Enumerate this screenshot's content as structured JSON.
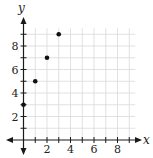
{
  "chart_data": {
    "type": "scatter",
    "title": "",
    "xlabel": "x",
    "ylabel": "y",
    "x": [
      0,
      1,
      2,
      3
    ],
    "y": [
      3,
      5,
      7,
      9
    ],
    "series": [
      {
        "name": "points",
        "x": [
          0,
          1,
          2,
          3
        ],
        "y": [
          3,
          5,
          7,
          9
        ]
      }
    ],
    "xlim": [
      -1,
      10
    ],
    "ylim": [
      -1,
      10
    ],
    "x_tick_labels": [
      "2",
      "4",
      "6",
      "8"
    ],
    "y_tick_labels": [
      "2",
      "4",
      "6",
      "8"
    ],
    "grid": true,
    "legend": "none"
  },
  "colors": {
    "grid": "#d9d9d9",
    "axis": "#1a1a1a",
    "point": "#111111"
  }
}
